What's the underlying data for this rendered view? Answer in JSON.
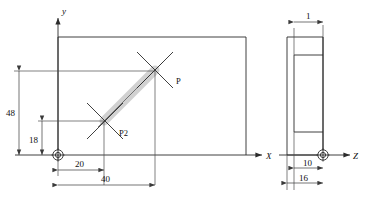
{
  "drawing": {
    "title": "Two-view engineering drawing with P and P2 tool positions",
    "views": [
      {
        "name": "front-view",
        "axes": {
          "horizontal": "X",
          "vertical": "y"
        }
      },
      {
        "name": "side-view",
        "axes": {
          "horizontal": "Z"
        }
      }
    ]
  },
  "axis_labels": {
    "y": "y",
    "x": "X",
    "z": "Z"
  },
  "points": [
    {
      "id": "P",
      "label": "P",
      "x_mm": 40,
      "y_mm": 48
    },
    {
      "id": "P2",
      "label": "P2",
      "x_mm": 20,
      "y_mm": 18
    }
  ],
  "dimensions": {
    "front": [
      {
        "name": "height-to-P",
        "value": "48",
        "units": "mm",
        "orientation": "vertical"
      },
      {
        "name": "height-to-P2",
        "value": "18",
        "units": "mm",
        "orientation": "vertical"
      },
      {
        "name": "x-to-P2",
        "value": "20",
        "units": "mm",
        "orientation": "horizontal"
      },
      {
        "name": "x-to-P",
        "value": "40",
        "units": "mm",
        "orientation": "horizontal"
      }
    ],
    "side": [
      {
        "name": "top-width",
        "value": "1",
        "units": "mm",
        "orientation": "horizontal"
      },
      {
        "name": "inner-width",
        "value": "10",
        "units": "mm",
        "orientation": "horizontal"
      },
      {
        "name": "outer-width",
        "value": "16",
        "units": "mm",
        "orientation": "horizontal"
      }
    ]
  },
  "symbols": {
    "origin_front": "datum-origin-icon",
    "origin_side": "datum-origin-icon",
    "arrow": "arrow-head-icon",
    "tool_mark": "cross-hair-icon",
    "highlight_band": "toolpath-highlight"
  },
  "colors": {
    "line": "#2b2b2b",
    "thin_line": "#4a4a4a",
    "dimension_line": "#3a3a3a",
    "highlight": "#cfcfcf",
    "background": "#ffffff",
    "text": "#111111"
  }
}
